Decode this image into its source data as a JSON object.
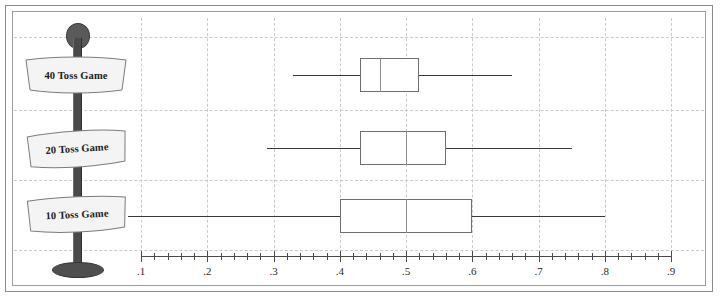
{
  "chart_data": {
    "type": "boxplot",
    "title": "",
    "xlabel": "",
    "ylabel": "",
    "orientation": "horizontal",
    "xlim": [
      0.1,
      0.9
    ],
    "xticks": [
      0.1,
      0.2,
      0.3,
      0.4,
      0.5,
      0.6,
      0.7,
      0.8,
      0.9
    ],
    "xtick_labels": [
      ".1",
      ".2",
      ".3",
      ".4",
      ".5",
      ".6",
      ".7",
      ".8",
      ".9"
    ],
    "minor_ticks_between": 4,
    "grid": true,
    "legend": "none",
    "categories": [
      "40 Toss Game",
      "20 Toss Game",
      "10 Toss Game"
    ],
    "boxes": [
      {
        "label": "40 Toss Game",
        "whisker_low": 0.33,
        "q1": 0.43,
        "median": 0.46,
        "q3": 0.52,
        "whisker_high": 0.66
      },
      {
        "label": "20 Toss Game",
        "whisker_low": 0.29,
        "q1": 0.43,
        "median": 0.5,
        "q3": 0.56,
        "whisker_high": 0.75
      },
      {
        "label": "10 Toss Game",
        "whisker_low": 0.08,
        "q1": 0.4,
        "median": 0.5,
        "q3": 0.6,
        "whisker_high": 0.8
      }
    ]
  },
  "signpost": {
    "signs": [
      {
        "label": "40 Toss Game"
      },
      {
        "label": "20 Toss Game"
      },
      {
        "label": "10 Toss Game"
      }
    ]
  },
  "colors": {
    "whisker": "#3a3a3a",
    "box_border": "#6e6e6e",
    "median": "#8d8d8d",
    "grid": "#c9c9c9",
    "axis": "#4a4a4a",
    "post": "#4a4a4a",
    "frame": "#8a8a8a"
  }
}
